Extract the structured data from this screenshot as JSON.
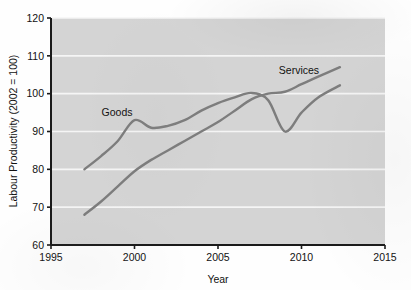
{
  "chart_data": {
    "type": "line",
    "title": "",
    "xlabel": "Year",
    "ylabel": "Labour Productivity (2002 = 100)",
    "xlim": [
      1995,
      2015
    ],
    "ylim": [
      60,
      120
    ],
    "xticks": [
      "1995",
      "2000",
      "2005",
      "2010",
      "2015"
    ],
    "yticks": [
      "60",
      "70",
      "80",
      "90",
      "100",
      "110",
      "120"
    ],
    "grid": "horizontal",
    "legend_position": "inline-annotations",
    "plot_background": "#d4d4d4",
    "line_color": "#7d7d7d",
    "series": [
      {
        "name": "Goods",
        "label": "Goods",
        "x": [
          1997,
          1998,
          1999,
          2000,
          2001,
          2002,
          2003,
          2004,
          2005,
          2006,
          2007,
          2008,
          2009,
          2010,
          2011,
          2012.3
        ],
        "values": [
          80.0,
          83.5,
          87.5,
          93.0,
          91.0,
          91.5,
          93.0,
          95.5,
          97.5,
          99.0,
          100.2,
          98.3,
          90.0,
          95.0,
          99.0,
          102.2
        ]
      },
      {
        "name": "Services",
        "label": "Services",
        "x": [
          1997,
          1998,
          1999,
          2000,
          2001,
          2002,
          2003,
          2004,
          2005,
          2006,
          2007,
          2008,
          2009,
          2010,
          2011,
          2012.3
        ],
        "values": [
          68.0,
          71.5,
          75.5,
          79.5,
          82.5,
          85.0,
          87.5,
          90.0,
          92.5,
          95.5,
          98.5,
          100.0,
          100.5,
          102.5,
          104.5,
          107.0
        ]
      }
    ]
  },
  "annotations": {
    "goods_label": "Goods",
    "services_label": "Services"
  }
}
